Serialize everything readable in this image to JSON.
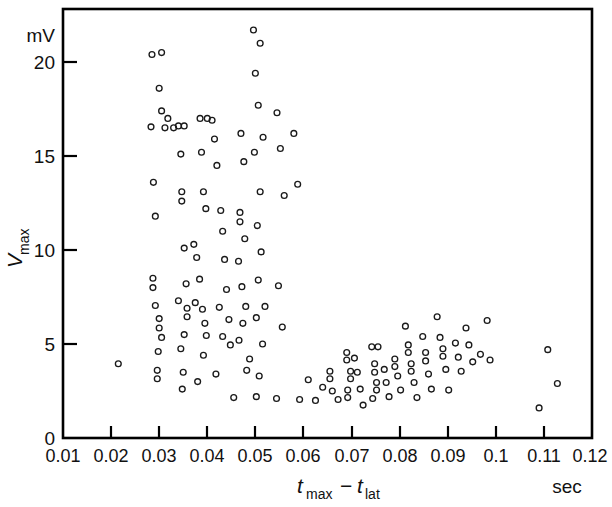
{
  "chart_data": {
    "type": "scatter",
    "title": "",
    "xlabel": "t_max − t_lat",
    "ylabel": "V_max",
    "x_unit": "sec",
    "y_unit": "mV",
    "xlim": [
      0.01,
      0.12
    ],
    "ylim": [
      0,
      21.9
    ],
    "grid": false,
    "legend": null,
    "xticks": [
      0.01,
      0.02,
      0.03,
      0.04,
      0.05,
      0.06,
      0.07,
      0.08,
      0.09,
      0.1,
      0.11,
      0.12
    ],
    "xtick_labels": [
      "0.01",
      "0.02",
      "0.03",
      "0.04",
      "0.05",
      "0.06",
      "0.07",
      "0.08",
      "0.09",
      "0.1",
      "0.11",
      "0.12"
    ],
    "yticks": [
      0,
      5,
      10,
      15,
      20
    ],
    "ytick_labels": [
      "0",
      "5",
      "10",
      "15",
      "20"
    ],
    "marker": "open-circle",
    "marker_color": "#1a1a1a",
    "points": [
      [
        0.0215,
        3.95
      ],
      [
        0.0285,
        20.4
      ],
      [
        0.0305,
        20.5
      ],
      [
        0.03,
        18.6
      ],
      [
        0.0305,
        17.4
      ],
      [
        0.0318,
        17.0
      ],
      [
        0.0283,
        16.55
      ],
      [
        0.0312,
        16.5
      ],
      [
        0.033,
        16.5
      ],
      [
        0.0288,
        13.6
      ],
      [
        0.0292,
        11.8
      ],
      [
        0.0287,
        8.5
      ],
      [
        0.0287,
        8.0
      ],
      [
        0.0292,
        7.05
      ],
      [
        0.03,
        6.35
      ],
      [
        0.03,
        5.85
      ],
      [
        0.0305,
        5.35
      ],
      [
        0.0298,
        4.6
      ],
      [
        0.0296,
        3.6
      ],
      [
        0.0296,
        3.15
      ],
      [
        0.034,
        16.6
      ],
      [
        0.0352,
        16.6
      ],
      [
        0.0345,
        15.1
      ],
      [
        0.0347,
        13.1
      ],
      [
        0.0347,
        12.6
      ],
      [
        0.0352,
        10.1
      ],
      [
        0.0356,
        8.2
      ],
      [
        0.034,
        7.3
      ],
      [
        0.0358,
        6.9
      ],
      [
        0.0358,
        6.45
      ],
      [
        0.0352,
        5.5
      ],
      [
        0.0345,
        4.75
      ],
      [
        0.035,
        3.5
      ],
      [
        0.0348,
        2.6
      ],
      [
        0.0385,
        17.0
      ],
      [
        0.04,
        17.0
      ],
      [
        0.041,
        16.9
      ],
      [
        0.0388,
        15.2
      ],
      [
        0.0392,
        13.1
      ],
      [
        0.0397,
        12.2
      ],
      [
        0.0372,
        10.3
      ],
      [
        0.0378,
        9.6
      ],
      [
        0.0384,
        8.45
      ],
      [
        0.0375,
        7.2
      ],
      [
        0.039,
        6.85
      ],
      [
        0.0395,
        6.1
      ],
      [
        0.0398,
        5.45
      ],
      [
        0.0392,
        4.4
      ],
      [
        0.038,
        3.0
      ],
      [
        0.0415,
        15.9
      ],
      [
        0.042,
        14.5
      ],
      [
        0.0428,
        12.1
      ],
      [
        0.0432,
        11.0
      ],
      [
        0.0436,
        9.5
      ],
      [
        0.044,
        7.9
      ],
      [
        0.0425,
        6.95
      ],
      [
        0.0445,
        6.3
      ],
      [
        0.0432,
        5.4
      ],
      [
        0.0448,
        4.95
      ],
      [
        0.0418,
        3.4
      ],
      [
        0.0455,
        2.15
      ],
      [
        0.047,
        16.2
      ],
      [
        0.0476,
        14.7
      ],
      [
        0.0468,
        12.0
      ],
      [
        0.0468,
        11.5
      ],
      [
        0.0478,
        10.6
      ],
      [
        0.0465,
        9.4
      ],
      [
        0.0472,
        8.05
      ],
      [
        0.048,
        7.0
      ],
      [
        0.0474,
        6.1
      ],
      [
        0.0466,
        5.2
      ],
      [
        0.0488,
        4.2
      ],
      [
        0.0482,
        3.6
      ],
      [
        0.0496,
        21.7
      ],
      [
        0.051,
        21.0
      ],
      [
        0.05,
        19.4
      ],
      [
        0.0506,
        17.7
      ],
      [
        0.0516,
        16.0
      ],
      [
        0.0498,
        15.2
      ],
      [
        0.051,
        13.1
      ],
      [
        0.0504,
        11.3
      ],
      [
        0.0512,
        9.9
      ],
      [
        0.0506,
        8.4
      ],
      [
        0.052,
        7.0
      ],
      [
        0.0502,
        6.4
      ],
      [
        0.0515,
        5.0
      ],
      [
        0.0508,
        3.3
      ],
      [
        0.0502,
        2.2
      ],
      [
        0.0545,
        17.3
      ],
      [
        0.0552,
        15.4
      ],
      [
        0.056,
        12.9
      ],
      [
        0.0548,
        8.1
      ],
      [
        0.0556,
        5.9
      ],
      [
        0.0544,
        2.1
      ],
      [
        0.058,
        16.2
      ],
      [
        0.0588,
        13.5
      ],
      [
        0.0592,
        2.05
      ],
      [
        0.061,
        3.1
      ],
      [
        0.0625,
        2.0
      ],
      [
        0.064,
        2.7
      ],
      [
        0.0655,
        3.55
      ],
      [
        0.0655,
        3.15
      ],
      [
        0.066,
        2.5
      ],
      [
        0.0672,
        2.05
      ],
      [
        0.069,
        4.55
      ],
      [
        0.069,
        4.15
      ],
      [
        0.0698,
        3.55
      ],
      [
        0.0698,
        3.15
      ],
      [
        0.0692,
        2.55
      ],
      [
        0.0692,
        2.15
      ],
      [
        0.0706,
        4.25
      ],
      [
        0.0712,
        3.5
      ],
      [
        0.0718,
        2.6
      ],
      [
        0.0724,
        1.75
      ],
      [
        0.0742,
        4.85
      ],
      [
        0.0755,
        4.85
      ],
      [
        0.0748,
        3.95
      ],
      [
        0.0748,
        3.5
      ],
      [
        0.0752,
        2.95
      ],
      [
        0.0752,
        2.55
      ],
      [
        0.0744,
        2.1
      ],
      [
        0.0768,
        3.65
      ],
      [
        0.0772,
        2.95
      ],
      [
        0.0778,
        2.2
      ],
      [
        0.079,
        4.2
      ],
      [
        0.079,
        3.8
      ],
      [
        0.0796,
        3.3
      ],
      [
        0.0802,
        2.55
      ],
      [
        0.0812,
        5.95
      ],
      [
        0.0818,
        4.95
      ],
      [
        0.0818,
        4.55
      ],
      [
        0.0824,
        3.95
      ],
      [
        0.0824,
        3.55
      ],
      [
        0.083,
        2.95
      ],
      [
        0.0836,
        2.15
      ],
      [
        0.0848,
        5.4
      ],
      [
        0.0854,
        4.55
      ],
      [
        0.0854,
        4.1
      ],
      [
        0.086,
        3.4
      ],
      [
        0.0866,
        2.6
      ],
      [
        0.0878,
        6.45
      ],
      [
        0.0884,
        5.35
      ],
      [
        0.089,
        4.75
      ],
      [
        0.089,
        4.35
      ],
      [
        0.0896,
        3.65
      ],
      [
        0.0902,
        2.55
      ],
      [
        0.0916,
        5.05
      ],
      [
        0.0922,
        4.3
      ],
      [
        0.0928,
        3.55
      ],
      [
        0.0938,
        5.85
      ],
      [
        0.0944,
        4.95
      ],
      [
        0.0952,
        4.05
      ],
      [
        0.0968,
        4.45
      ],
      [
        0.0982,
        6.25
      ],
      [
        0.0988,
        4.15
      ],
      [
        0.109,
        1.6
      ],
      [
        0.1108,
        4.7
      ],
      [
        0.1128,
        2.9
      ]
    ]
  },
  "axes": {
    "y_unit_label": "mV",
    "x_unit_label": "sec",
    "y_title_main": "V",
    "y_title_sub": "max",
    "x_title_t1": "t",
    "x_title_sub1": "max",
    "x_title_minus": "−",
    "x_title_t2": "t",
    "x_title_sub2": "lat"
  }
}
